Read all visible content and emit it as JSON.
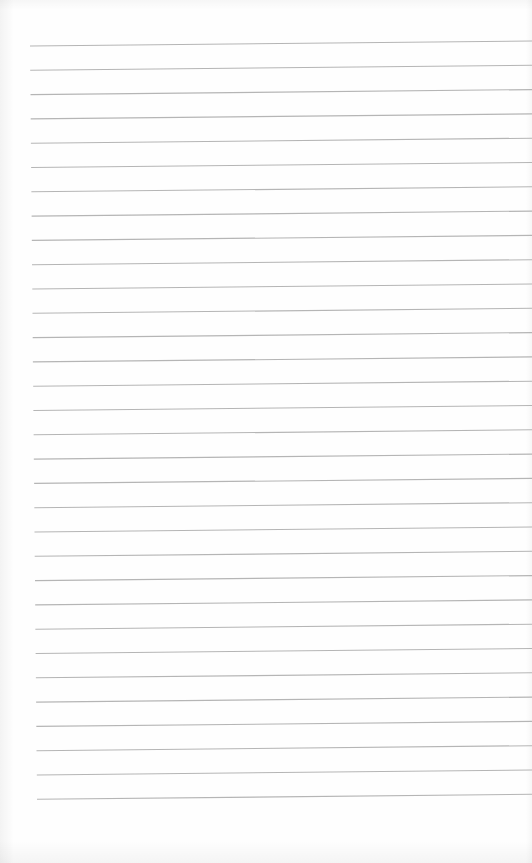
{
  "page": {
    "type": "lined-paper",
    "background_color": "#fefefe",
    "text_content": ""
  },
  "rules": {
    "count": 32,
    "color": "#b5b5b5",
    "stroke_width": 1.1,
    "first_left_y": 46,
    "first_right_y": 41,
    "spacing": 24.3,
    "left_x_start": 30,
    "left_x_end": 37,
    "right_x": 532
  }
}
